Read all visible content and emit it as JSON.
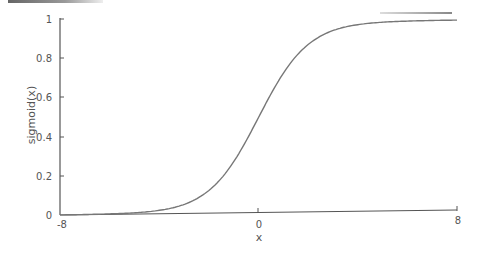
{
  "chart_data": {
    "type": "line",
    "title": "",
    "xlabel": "x",
    "ylabel": "sigmoid(x)",
    "xlim": [
      -8,
      8
    ],
    "ylim": [
      0,
      1
    ],
    "grid": false,
    "legend": null,
    "x_ticks": [
      "-8",
      "0",
      "8"
    ],
    "y_ticks": [
      "0",
      "0.2",
      "0.4",
      "0.6",
      "0.8",
      "1"
    ],
    "series": [
      {
        "name": "sigmoid(x)",
        "function": "1/(1+exp(-x))",
        "x": [
          -8,
          -6,
          -4,
          -3,
          -2,
          -1,
          0,
          1,
          2,
          3,
          4,
          6,
          8
        ],
        "values": [
          0.0003,
          0.0025,
          0.018,
          0.047,
          0.119,
          0.269,
          0.5,
          0.731,
          0.881,
          0.953,
          0.982,
          0.9975,
          0.9997
        ]
      }
    ],
    "colors": {
      "line": "#777777",
      "axis": "#555555"
    }
  }
}
